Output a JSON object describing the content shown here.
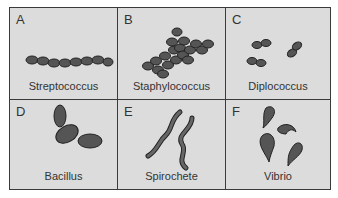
{
  "figure": {
    "panels": [
      {
        "letter": "A",
        "name": "Streptococcus"
      },
      {
        "letter": "B",
        "name": "Staphylococcus"
      },
      {
        "letter": "C",
        "name": "Diplococcus"
      },
      {
        "letter": "D",
        "name": "Bacillus"
      },
      {
        "letter": "E",
        "name": "Spirochete"
      },
      {
        "letter": "F",
        "name": "Vibrio"
      }
    ],
    "colors": {
      "background": "#dcdcdc",
      "border": "#3a3a3a",
      "cell_fill": "#4a4a4a"
    }
  }
}
